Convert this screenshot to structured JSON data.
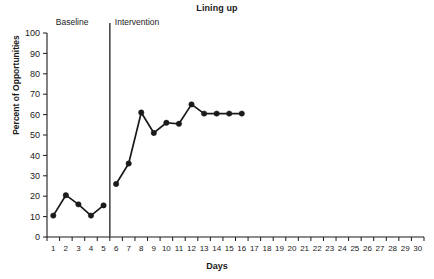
{
  "chart_data": {
    "type": "line",
    "title": "Lining up",
    "xlabel": "Days",
    "ylabel": "Percent of Opportunities",
    "xlim": [
      0,
      30
    ],
    "ylim": [
      0,
      100
    ],
    "grid": false,
    "legend": "none",
    "x_tick_labels": [
      "1",
      "2",
      "3",
      "4",
      "5",
      "6",
      "7",
      "8",
      "9",
      "10",
      "11",
      "12",
      "13",
      "14",
      "15",
      "16",
      "17",
      "18",
      "19",
      "20",
      "21",
      "22",
      "23",
      "24",
      "25",
      "26",
      "27",
      "28",
      "29",
      "30"
    ],
    "y_tick_labels": [
      "0",
      "10",
      "20",
      "30",
      "40",
      "50",
      "60",
      "70",
      "80",
      "90",
      "100"
    ],
    "y_ticks": [
      0,
      10,
      20,
      30,
      40,
      50,
      60,
      70,
      80,
      90,
      100
    ],
    "phase_change_line_after_x": 5,
    "annotations": [
      {
        "name": "baseline-label",
        "text": "Baseline",
        "x": 1.2,
        "y": 100
      },
      {
        "name": "intervention-label",
        "text": "Intervention",
        "x": 5.9,
        "y": 100
      }
    ],
    "series": [
      {
        "name": "Baseline",
        "x": [
          1,
          2,
          3,
          4,
          5
        ],
        "values": [
          10.5,
          20.5,
          16,
          10.5,
          15.5
        ]
      },
      {
        "name": "Intervention",
        "x": [
          6,
          7,
          8,
          9,
          10,
          11,
          12,
          13,
          14,
          15,
          16
        ],
        "values": [
          26,
          36,
          61,
          51,
          56,
          55.5,
          65,
          60.5,
          60.5,
          60.5,
          60.5
        ]
      }
    ]
  },
  "colors": {
    "line": "#1a1a1a",
    "marker": "#1a1a1a",
    "axis": "#1a1a1a",
    "phase_line": "#4a4a4a",
    "background": "#ffffff"
  }
}
